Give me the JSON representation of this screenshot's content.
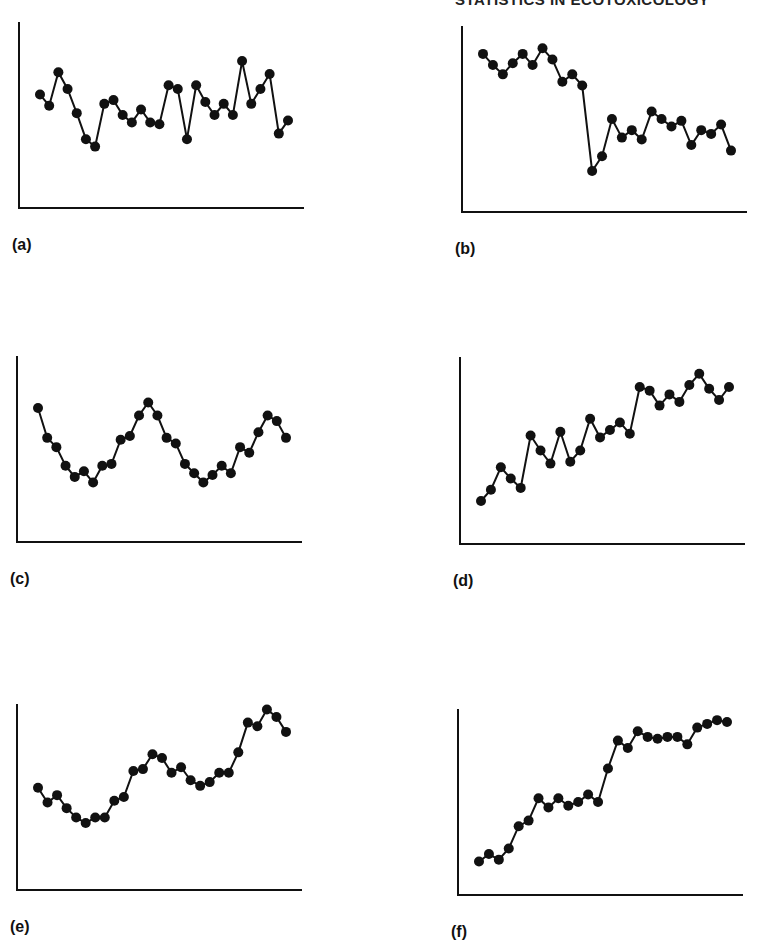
{
  "header": {
    "running_title": "STATISTICS IN ECOTOXICOLOGY"
  },
  "chart_data": [
    {
      "id": "a",
      "label": "(a)",
      "type": "line",
      "title": "",
      "xlabel": "",
      "ylabel": "",
      "grid": false,
      "ylim": [
        0,
        100
      ],
      "box": {
        "left": 18,
        "top": 22,
        "width": 286,
        "height": 186
      },
      "values": [
        61,
        55,
        73,
        64,
        51,
        37,
        33,
        56,
        58,
        50,
        46,
        53,
        46,
        45,
        66,
        64,
        37,
        66,
        57,
        50,
        56,
        50,
        79,
        56,
        64,
        72,
        40,
        47
      ]
    },
    {
      "id": "b",
      "label": "(b)",
      "type": "line",
      "title": "",
      "xlabel": "",
      "ylabel": "",
      "grid": false,
      "ylim": [
        0,
        100
      ],
      "box": {
        "left": 461,
        "top": 26,
        "width": 286,
        "height": 186
      },
      "values": [
        85,
        79,
        74,
        80,
        85,
        79,
        88,
        82,
        70,
        74,
        68,
        22,
        30,
        50,
        40,
        44,
        39,
        54,
        50,
        46,
        49,
        36,
        44,
        42,
        47,
        33
      ]
    },
    {
      "id": "c",
      "label": "(c)",
      "type": "line",
      "title": "",
      "xlabel": "",
      "ylabel": "",
      "grid": false,
      "ylim": [
        0,
        100
      ],
      "box": {
        "left": 16,
        "top": 356,
        "width": 286,
        "height": 186
      },
      "values": [
        72,
        56,
        51,
        41,
        35,
        38,
        32,
        41,
        42,
        55,
        57,
        68,
        75,
        68,
        56,
        53,
        42,
        37,
        32,
        36,
        41,
        37,
        51,
        48,
        59,
        68,
        65,
        56
      ]
    },
    {
      "id": "d",
      "label": "(d)",
      "type": "line",
      "title": "",
      "xlabel": "",
      "ylabel": "",
      "grid": false,
      "ylim": [
        0,
        100
      ],
      "box": {
        "left": 459,
        "top": 357,
        "width": 286,
        "height": 187
      },
      "values": [
        23,
        29,
        41,
        35,
        30,
        58,
        50,
        43,
        60,
        44,
        50,
        67,
        57,
        61,
        65,
        59,
        84,
        82,
        74,
        80,
        76,
        85,
        91,
        83,
        77,
        84
      ]
    },
    {
      "id": "e",
      "label": "(e)",
      "type": "line",
      "title": "",
      "xlabel": "",
      "ylabel": "",
      "grid": false,
      "ylim": [
        0,
        100
      ],
      "box": {
        "left": 16,
        "top": 704,
        "width": 286,
        "height": 186
      },
      "values": [
        55,
        47,
        51,
        44,
        39,
        36,
        39,
        39,
        48,
        50,
        64,
        65,
        73,
        71,
        63,
        66,
        59,
        56,
        58,
        63,
        63,
        74,
        90,
        88,
        97,
        93,
        85
      ]
    },
    {
      "id": "f",
      "label": "(f)",
      "type": "line",
      "title": "",
      "xlabel": "",
      "ylabel": "",
      "grid": false,
      "ylim": [
        0,
        100
      ],
      "box": {
        "left": 457,
        "top": 709,
        "width": 286,
        "height": 186
      },
      "values": [
        18,
        22,
        19,
        25,
        37,
        40,
        52,
        47,
        52,
        48,
        50,
        54,
        50,
        68,
        83,
        79,
        88,
        85,
        84,
        85,
        85,
        81,
        90,
        92,
        94,
        93
      ]
    }
  ]
}
